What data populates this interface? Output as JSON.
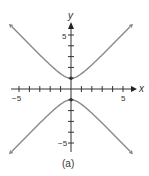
{
  "chart_data": {
    "type": "line",
    "title": "",
    "caption": "(a)",
    "xlabel": "x",
    "ylabel": "y",
    "xlim": [
      -6.5,
      6.5
    ],
    "ylim": [
      -6.5,
      6.5
    ],
    "x_tick_labels": [
      "-5",
      "5"
    ],
    "y_tick_labels": [
      "5",
      "-5"
    ],
    "ticks_every": 1,
    "grid": false,
    "equation": "y^2 - x^2 = 1",
    "series": [
      {
        "name": "upper branch",
        "x": [
          -6,
          -4,
          -2,
          -1,
          0,
          1,
          2,
          4,
          6
        ],
        "values": [
          6.08,
          4.12,
          2.24,
          1.41,
          1,
          1.41,
          2.24,
          4.12,
          6.08
        ]
      },
      {
        "name": "lower branch",
        "x": [
          -6,
          -4,
          -2,
          -1,
          0,
          1,
          2,
          4,
          6
        ],
        "values": [
          -6.08,
          -4.12,
          -2.24,
          -1.41,
          -1,
          -1.41,
          -2.24,
          -4.12,
          -6.08
        ]
      }
    ],
    "points": [
      {
        "x": 0,
        "y": 1
      },
      {
        "x": 0,
        "y": -1
      }
    ],
    "colors": {
      "curve": "#8a8a8a",
      "axis": "#333333"
    }
  }
}
